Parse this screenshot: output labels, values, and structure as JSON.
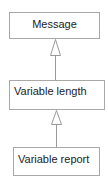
{
  "diagram": {
    "type": "uml-inheritance",
    "colors": {
      "border": "#a8a8a8",
      "text": "#222222",
      "arrow": "#9a9a9a",
      "background": "#ffffff"
    },
    "classes": [
      {
        "id": "message",
        "label": "Message"
      },
      {
        "id": "variable-length",
        "label": "Variable length"
      },
      {
        "id": "variable-report",
        "label": "Variable report"
      }
    ],
    "relations": [
      {
        "from": "variable-length",
        "to": "message",
        "kind": "generalization"
      },
      {
        "from": "variable-report",
        "to": "variable-length",
        "kind": "generalization"
      }
    ]
  }
}
